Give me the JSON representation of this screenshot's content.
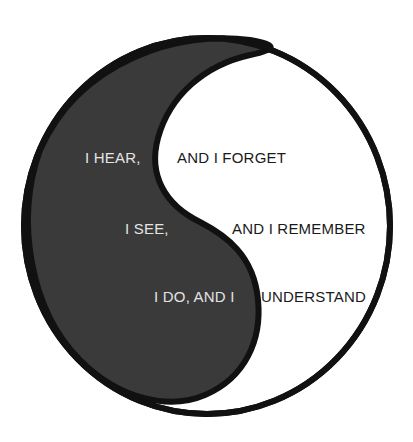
{
  "diagram": {
    "type": "yin-yang",
    "colors": {
      "dark_fill": "#3a3a3a",
      "outline": "#111111",
      "light_fill": "#ffffff",
      "text_on_dark": "#e4e4e4",
      "text_on_light": "#1a1a1a"
    },
    "left_column": [
      {
        "text": "I HEAR,"
      },
      {
        "text": "I SEE,"
      },
      {
        "text": "I DO, AND I"
      }
    ],
    "right_column": [
      {
        "text": "AND I FORGET"
      },
      {
        "text": "AND I REMEMBER"
      },
      {
        "text": "UNDERSTAND"
      }
    ]
  }
}
